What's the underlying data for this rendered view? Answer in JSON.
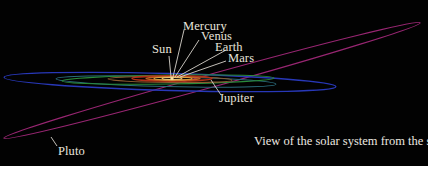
{
  "figure": {
    "caption": "View of the solar system from the side",
    "background": "#020202",
    "labels": {
      "sun": "Sun",
      "mercury": "Mercury",
      "venus": "Venus",
      "earth": "Earth",
      "mars": "Mars",
      "jupiter": "Jupiter",
      "pluto": "Pluto"
    },
    "orbit_colors": {
      "mercury": "#e8c070",
      "venus": "#d8a040",
      "earth": "#c06020",
      "mars": "#b03018",
      "jupiter": "#c0b090",
      "saturn": "#2a8a3a",
      "uranus": "#2a6a7a",
      "neptune": "#2838b8",
      "pluto": "#a02878"
    },
    "leader_line_color": "#d8d4cc"
  }
}
